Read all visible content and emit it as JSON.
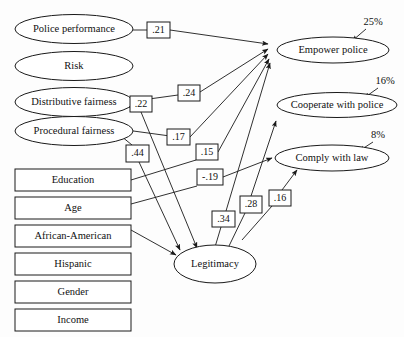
{
  "diagram": {
    "type": "path-diagram",
    "background_color": "#fdfdfd",
    "line_color": "#1a1a1a",
    "predictors": [
      {
        "id": "police_performance",
        "label": "Police performance",
        "shape": "ellipse"
      },
      {
        "id": "risk",
        "label": "Risk",
        "shape": "ellipse"
      },
      {
        "id": "distributive_fairness",
        "label": "Distributive fairness",
        "shape": "ellipse"
      },
      {
        "id": "procedural_fairness",
        "label": "Procedural fairness",
        "shape": "ellipse"
      },
      {
        "id": "education",
        "label": "Education",
        "shape": "rectangle"
      },
      {
        "id": "age",
        "label": "Age",
        "shape": "rectangle"
      },
      {
        "id": "african_american",
        "label": "African-American",
        "shape": "rectangle"
      },
      {
        "id": "hispanic",
        "label": "Hispanic",
        "shape": "rectangle"
      },
      {
        "id": "gender",
        "label": "Gender",
        "shape": "rectangle"
      },
      {
        "id": "income",
        "label": "Income",
        "shape": "rectangle"
      }
    ],
    "outcomes": [
      {
        "id": "empower_police",
        "label": "Empower police",
        "shape": "ellipse",
        "variance": "25%"
      },
      {
        "id": "cooperate_with_police",
        "label": "Cooperate with police",
        "shape": "ellipse",
        "variance": "16%"
      },
      {
        "id": "comply_with_law",
        "label": "Comply with law",
        "shape": "ellipse",
        "variance": "8%"
      }
    ],
    "mediator": {
      "id": "legitimacy",
      "label": "Legitimacy",
      "shape": "ellipse"
    },
    "coefficients": [
      {
        "id": "coef_21",
        "value": ".21",
        "from": "police_performance",
        "to": "empower_police"
      },
      {
        "id": "coef_22",
        "value": ".22",
        "from": "distributive_fairness",
        "to": "legitimacy"
      },
      {
        "id": "coef_24",
        "value": ".24",
        "from": "distributive_fairness",
        "to": "empower_police"
      },
      {
        "id": "coef_17",
        "value": ".17",
        "from": "procedural_fairness",
        "to": "empower_police"
      },
      {
        "id": "coef_15",
        "value": ".15",
        "from": "education",
        "to": "empower_police"
      },
      {
        "id": "coef_44",
        "value": ".44",
        "from": "procedural_fairness",
        "to": "legitimacy"
      },
      {
        "id": "coef_neg19",
        "value": "-.19",
        "from": "african_american",
        "to": "comply_with_law"
      },
      {
        "id": "coef_34",
        "value": ".34",
        "from": "legitimacy",
        "to": "empower_police"
      },
      {
        "id": "coef_28",
        "value": ".28",
        "from": "legitimacy",
        "to": "cooperate_with_police"
      },
      {
        "id": "coef_16",
        "value": ".16",
        "from": "legitimacy",
        "to": "comply_with_law"
      }
    ]
  }
}
